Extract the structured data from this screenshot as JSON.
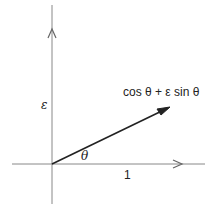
{
  "diagram": {
    "type": "vector-diagram",
    "axes": {
      "horizontal_unit_label": "1",
      "vertical_label": "ε"
    },
    "angle_label": "θ",
    "vector_label": "cos θ + ε sin θ",
    "colors": {
      "axis": "#777777",
      "vector": "#222222",
      "text": "#222222"
    }
  }
}
